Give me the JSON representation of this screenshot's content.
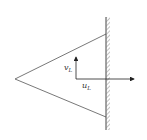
{
  "diagram": {
    "type": "flow-wedge-wall",
    "colors": {
      "line": "#555555",
      "wall": "#444444",
      "hatch": "#666666",
      "arrow": "#222222",
      "background": "#ffffff"
    },
    "triangle": {
      "apex": [
        15,
        79
      ],
      "upper": [
        106,
        34
      ],
      "lower": [
        106,
        117
      ]
    },
    "wall": {
      "x": 106,
      "y1": 17,
      "y2": 130,
      "hatch_side": "right"
    },
    "axes": {
      "origin": [
        76,
        79
      ],
      "vertical": {
        "to": [
          76,
          57
        ],
        "label": "v",
        "subscript": "L"
      },
      "horizontal": {
        "to": [
          134,
          79
        ],
        "label": "u",
        "subscript": "L"
      }
    }
  }
}
